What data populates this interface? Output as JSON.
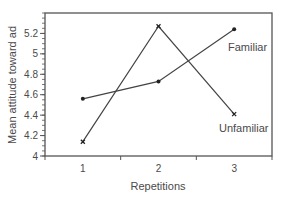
{
  "chart_data": {
    "type": "line",
    "title": "",
    "xlabel": "Repetitions",
    "ylabel": "Mean attitude toward ad",
    "categories": [
      "1",
      "2",
      "3"
    ],
    "x": [
      1,
      2,
      3
    ],
    "ylim": [
      4,
      5.4
    ],
    "yticks": [
      "4",
      "4.2",
      "4.4",
      "4.6",
      "4.8",
      "5",
      "5.2"
    ],
    "ytick_values": [
      4,
      4.2,
      4.4,
      4.6,
      4.8,
      5.0,
      5.2
    ],
    "y_minor_tick_step": 0.05,
    "grid": false,
    "legend_position": "inline labels at right end of each line",
    "series": [
      {
        "name": "Familiar",
        "marker": "dot",
        "values": [
          4.56,
          4.73,
          5.24
        ]
      },
      {
        "name": "Unfamiliar",
        "marker": "x",
        "values": [
          4.14,
          5.27,
          4.41
        ]
      }
    ],
    "annotations": [
      {
        "text": "Familiar",
        "near": "series Familiar, x=3"
      },
      {
        "text": "Unfamiliar",
        "near": "series Unfamiliar, x=3"
      }
    ]
  },
  "colors": {
    "axis": "#555555",
    "line": "#444444",
    "text": "#4a4a4a"
  }
}
